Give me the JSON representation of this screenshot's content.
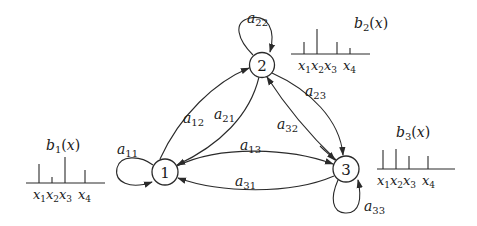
{
  "diagram": {
    "states": [
      {
        "id": "1",
        "label": "1",
        "cx": 165,
        "cy": 172
      },
      {
        "id": "2",
        "label": "2",
        "cx": 262,
        "cy": 65
      },
      {
        "id": "3",
        "label": "3",
        "cx": 346,
        "cy": 169
      }
    ],
    "transitions": [
      {
        "from": "1",
        "to": "1",
        "label": "a",
        "sub": "11"
      },
      {
        "from": "1",
        "to": "2",
        "label": "a",
        "sub": "12"
      },
      {
        "from": "1",
        "to": "3",
        "label": "a",
        "sub": "13"
      },
      {
        "from": "2",
        "to": "1",
        "label": "a",
        "sub": "21"
      },
      {
        "from": "2",
        "to": "2",
        "label": "a",
        "sub": "22"
      },
      {
        "from": "2",
        "to": "3",
        "label": "a",
        "sub": "23"
      },
      {
        "from": "3",
        "to": "1",
        "label": "a",
        "sub": "31"
      },
      {
        "from": "3",
        "to": "2",
        "label": "a",
        "sub": "32"
      },
      {
        "from": "3",
        "to": "3",
        "label": "a",
        "sub": "33"
      }
    ],
    "emissions": [
      {
        "state": "1",
        "label": "b",
        "sub": "1",
        "arg": "(x)",
        "symbols": [
          "x1",
          "x2",
          "x3",
          "x4"
        ],
        "heights": [
          19,
          6,
          26,
          13
        ]
      },
      {
        "state": "2",
        "label": "b",
        "sub": "2",
        "arg": "(x)",
        "symbols": [
          "x1",
          "x2",
          "x3",
          "x4"
        ],
        "heights": [
          12,
          25,
          12,
          6
        ]
      },
      {
        "state": "3",
        "label": "b",
        "sub": "3",
        "arg": "(x)",
        "symbols": [
          "x1",
          "x2",
          "x3",
          "x4"
        ],
        "heights": [
          19,
          20,
          13,
          13
        ]
      }
    ],
    "symbol_labels": {
      "x": "x",
      "subs": [
        "1",
        "2",
        "3",
        "4"
      ]
    },
    "colors": {
      "stroke": "#2a2a2a",
      "background": "#ffffff"
    }
  }
}
